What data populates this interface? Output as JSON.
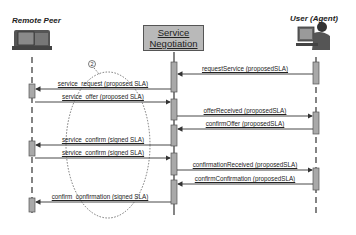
{
  "diagram": {
    "type": "sequence",
    "actors": [
      {
        "id": "remote",
        "label": "Remote Peer",
        "icon": "server-computer-icon",
        "x": 32
      },
      {
        "id": "neg",
        "label_line1": "Service",
        "label_line2": "Negotiation",
        "x": 174
      },
      {
        "id": "user",
        "label": "User (Agent)",
        "icon": "user-at-computer-icon",
        "x": 316
      }
    ],
    "marker": {
      "label": "2"
    },
    "messages": [
      {
        "label": "requestService (proposedSLA)",
        "from": "user",
        "to": "neg",
        "y": 74
      },
      {
        "label": "service_request (proposed SLA)",
        "from": "neg",
        "to": "remote",
        "y": 89
      },
      {
        "label": "service_offer (proposed SLA)",
        "from": "remote",
        "to": "neg",
        "y": 102
      },
      {
        "label": "offerReceived (proposedSLA)",
        "from": "neg",
        "to": "user",
        "y": 116
      },
      {
        "label": "confirmOffer (proposedSLA)",
        "from": "user",
        "to": "neg",
        "y": 129
      },
      {
        "label": "service_confirm (signed SLA)",
        "from": "neg",
        "to": "remote",
        "y": 145
      },
      {
        "label": "service_confirm (signed SLA)",
        "from": "remote",
        "to": "neg",
        "y": 158
      },
      {
        "label": "confirmationReceived (proposedSLA)",
        "from": "neg",
        "to": "user",
        "y": 170
      },
      {
        "label": "confirmConfirmation (proposedSLA)",
        "from": "user",
        "to": "neg",
        "y": 184
      },
      {
        "label": "confirm_confirmation (signed SLA)",
        "from": "neg",
        "to": "remote",
        "y": 202
      }
    ],
    "colors": {
      "activation": "#a9a9a9",
      "line": "#333333",
      "box": "#b9b9b9"
    }
  }
}
